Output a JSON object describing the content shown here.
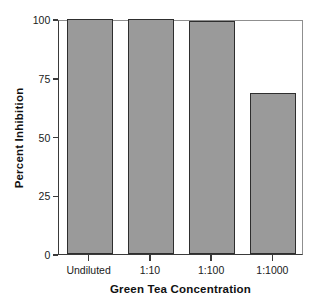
{
  "chart_data": {
    "type": "bar",
    "title": "",
    "xlabel": "Green Tea Concentration",
    "ylabel": "Percent Inhibition",
    "categories": [
      "Undiluted",
      "1:10",
      "1:100",
      "1:1000"
    ],
    "values": [
      100,
      100,
      99,
      68.5
    ],
    "ylim": [
      0,
      100
    ],
    "yticks": [
      0,
      25,
      50,
      75,
      100
    ],
    "ytick_labels": [
      "0",
      "25",
      "50",
      "75",
      "100"
    ],
    "grid": false,
    "legend": null,
    "series": [
      {
        "name": "Percent Inhibition",
        "values": [
          100,
          100,
          99,
          68.5
        ]
      }
    ],
    "colors": {
      "bar_fill": "#9a9a9a",
      "bar_edge": "#2e2e2e",
      "axis": "#3a3a3a",
      "frame": "#8f8f8f",
      "text": "#111111",
      "background": "#ffffff"
    }
  }
}
